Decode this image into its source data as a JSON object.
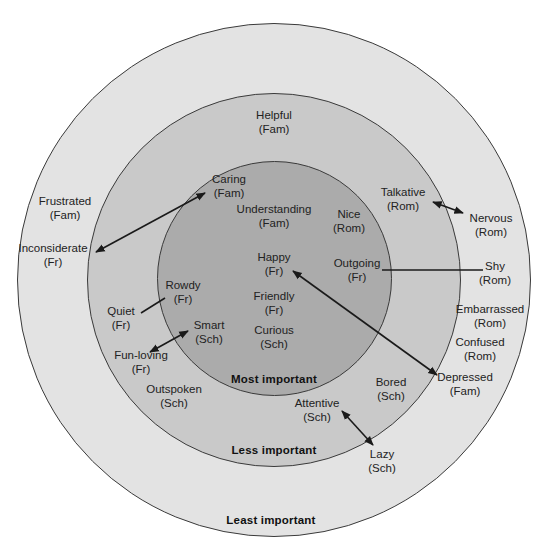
{
  "diagram": {
    "type": "concentric-importance-circles",
    "colors": {
      "outer_ring": "#e3e3e3",
      "middle_ring": "#c9c9c9",
      "inner_ring": "#ababab",
      "line": "#1a1a1a"
    },
    "zones": {
      "inner": "Most important",
      "middle": "Less important",
      "outer": "Least important"
    },
    "traits": [
      {
        "id": "helpful",
        "word": "Helpful",
        "group": "(Fam)",
        "zone": "middle",
        "x": 274,
        "y": 115
      },
      {
        "id": "caring",
        "word": "Caring",
        "group": "(Fam)",
        "zone": "inner",
        "x": 229,
        "y": 179
      },
      {
        "id": "understanding",
        "word": "Understanding",
        "group": "(Fam)",
        "zone": "inner",
        "x": 274,
        "y": 209
      },
      {
        "id": "nice",
        "word": "Nice",
        "group": "(Rom)",
        "zone": "inner",
        "x": 349,
        "y": 214
      },
      {
        "id": "talkative",
        "word": "Talkative",
        "group": "(Rom)",
        "zone": "middle",
        "x": 403,
        "y": 192
      },
      {
        "id": "nervous",
        "word": "Nervous",
        "group": "(Rom)",
        "zone": "outer",
        "x": 491,
        "y": 218
      },
      {
        "id": "frustrated",
        "word": "Frustrated",
        "group": "(Fam)",
        "zone": "outer",
        "x": 65,
        "y": 201
      },
      {
        "id": "inconsiderate",
        "word": "Inconsiderate",
        "group": "(Fr)",
        "zone": "outer",
        "x": 53,
        "y": 248
      },
      {
        "id": "happy",
        "word": "Happy",
        "group": "(Fr)",
        "zone": "inner",
        "x": 274,
        "y": 257
      },
      {
        "id": "outgoing",
        "word": "Outgoing",
        "group": "(Fr)",
        "zone": "inner",
        "x": 357,
        "y": 263
      },
      {
        "id": "shy",
        "word": "Shy",
        "group": "(Rom)",
        "zone": "outer",
        "x": 495,
        "y": 266
      },
      {
        "id": "rowdy",
        "word": "Rowdy",
        "group": "(Fr)",
        "zone": "inner",
        "x": 183,
        "y": 285
      },
      {
        "id": "quiet",
        "word": "Quiet",
        "group": "(Fr)",
        "zone": "middle",
        "x": 121,
        "y": 311
      },
      {
        "id": "friendly",
        "word": "Friendly",
        "group": "(Fr)",
        "zone": "inner",
        "x": 274,
        "y": 296
      },
      {
        "id": "smart",
        "word": "Smart",
        "group": "(Sch)",
        "zone": "inner",
        "x": 209,
        "y": 325
      },
      {
        "id": "curious",
        "word": "Curious",
        "group": "(Sch)",
        "zone": "inner",
        "x": 274,
        "y": 330
      },
      {
        "id": "embarrassed",
        "word": "Embarrassed",
        "group": "(Rom)",
        "zone": "outer",
        "x": 490,
        "y": 309
      },
      {
        "id": "confused",
        "word": "Confused",
        "group": "(Rom)",
        "zone": "outer",
        "x": 480,
        "y": 342
      },
      {
        "id": "fun_loving",
        "word": "Fun-loving",
        "group": "(Fr)",
        "zone": "middle",
        "x": 141,
        "y": 355
      },
      {
        "id": "outspoken",
        "word": "Outspoken",
        "group": "(Sch)",
        "zone": "middle",
        "x": 174,
        "y": 389
      },
      {
        "id": "depressed",
        "word": "Depressed",
        "group": "(Fam)",
        "zone": "outer",
        "x": 465,
        "y": 377
      },
      {
        "id": "bored",
        "word": "Bored",
        "group": "(Sch)",
        "zone": "middle",
        "x": 391,
        "y": 382
      },
      {
        "id": "attentive",
        "word": "Attentive",
        "group": "(Sch)",
        "zone": "middle",
        "x": 317,
        "y": 403
      },
      {
        "id": "lazy",
        "word": "Lazy",
        "group": "(Sch)",
        "zone": "outer",
        "x": 382,
        "y": 454
      }
    ],
    "links": [
      {
        "from": "inconsiderate",
        "to": "caring",
        "x1": 96,
        "y1": 252,
        "x2": 205,
        "y2": 193,
        "arrows": "both"
      },
      {
        "from": "talkative",
        "to": "nervous",
        "x1": 433,
        "y1": 202,
        "x2": 463,
        "y2": 213,
        "arrows": "both"
      },
      {
        "from": "outgoing",
        "to": "shy",
        "x1": 382,
        "y1": 270,
        "x2": 483,
        "y2": 270,
        "arrows": "none"
      },
      {
        "from": "happy",
        "to": "depressed",
        "x1": 293,
        "y1": 271,
        "x2": 437,
        "y2": 375,
        "arrows": "both"
      },
      {
        "from": "quiet",
        "to": "rowdy",
        "x1": 141,
        "y1": 313,
        "x2": 165,
        "y2": 298,
        "arrows": "none"
      },
      {
        "from": "fun_loving",
        "to": "smart",
        "x1": 150,
        "y1": 352,
        "x2": 188,
        "y2": 331,
        "arrows": "both"
      },
      {
        "from": "attentive",
        "to": "lazy",
        "x1": 342,
        "y1": 411,
        "x2": 373,
        "y2": 445,
        "arrows": "both"
      }
    ]
  }
}
